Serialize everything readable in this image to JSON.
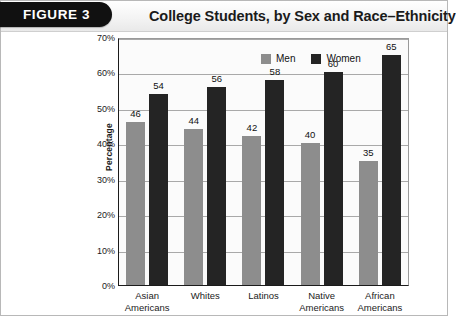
{
  "header": {
    "badge_label": "FIGURE 3",
    "title": "College Students, by Sex and Race–Ethnicity"
  },
  "chart_data": {
    "type": "bar",
    "title": "College Students, by Sex and Race–Ethnicity",
    "xlabel": "",
    "ylabel": "Percentage",
    "ylim": [
      0,
      70
    ],
    "ytick_labels": [
      "0%",
      "10%",
      "20%",
      "30%",
      "40%",
      "50%",
      "60%",
      "70%"
    ],
    "ytick_values": [
      0,
      10,
      20,
      30,
      40,
      50,
      60,
      70
    ],
    "grid": true,
    "legend_position": "top-left-inside",
    "categories": [
      "Asian\nAmericans",
      "Whites",
      "Latinos",
      "Native\nAmericans",
      "African\nAmericans"
    ],
    "category_lines": [
      [
        "Asian",
        "Americans"
      ],
      [
        "Whites",
        ""
      ],
      [
        "Latinos",
        ""
      ],
      [
        "Native",
        "Americans"
      ],
      [
        "African",
        "Americans"
      ]
    ],
    "series": [
      {
        "name": "Men",
        "color": "#8d8d8d",
        "values": [
          46,
          44,
          42,
          40,
          35
        ]
      },
      {
        "name": "Women",
        "color": "#242424",
        "values": [
          54,
          56,
          58,
          60,
          65
        ]
      }
    ]
  },
  "legend": {
    "items": [
      {
        "label": "Men",
        "swatch": "men"
      },
      {
        "label": "Women",
        "swatch": "women"
      }
    ]
  }
}
